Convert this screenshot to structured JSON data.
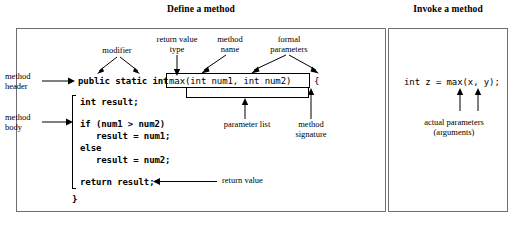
{
  "figure": {
    "left_panel": {
      "title": "Define a method",
      "side_labels": [
        {
          "name": "method-header",
          "text": "method\nheader"
        },
        {
          "name": "method-body",
          "text": "method\nbody"
        }
      ],
      "top_labels": [
        {
          "name": "modifier",
          "text": "modifier"
        },
        {
          "name": "return-value-type",
          "text": "return value\ntype"
        },
        {
          "name": "method-name",
          "text": "method\nname"
        },
        {
          "name": "formal-parameters",
          "text": "formal\nparameters"
        }
      ],
      "code": {
        "header_modifiers": "public static int",
        "signature": "max(int num1, int num2)",
        "open_brace": "{",
        "body_lines": [
          "int result;",
          "",
          "if (num1 > num2)",
          "   result = num1;",
          "else",
          "   result = num2;",
          "",
          "return result;"
        ],
        "close_brace": "}"
      },
      "bottom_labels": [
        {
          "name": "parameter-list",
          "text": "parameter list"
        },
        {
          "name": "method-signature",
          "text": "method\nsignature"
        },
        {
          "name": "return-value",
          "text": "return value"
        }
      ]
    },
    "right_panel": {
      "title": "Invoke a method",
      "code": "int z = max(x, y);",
      "label": {
        "name": "actual-parameters",
        "text": "actual parameters\n(arguments)"
      }
    }
  },
  "colors": {
    "frame": "#6e6e74",
    "ink": "#000000",
    "background": "#ffffff"
  }
}
